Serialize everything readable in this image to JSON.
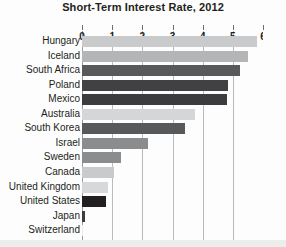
{
  "chart_data": {
    "type": "bar",
    "orientation": "horizontal",
    "title": "Short-Term Interest Rate, 2012",
    "xlabel": "",
    "ylabel": "",
    "xlim": [
      0,
      6
    ],
    "xticks": [
      0,
      1,
      2,
      3,
      4,
      5,
      6
    ],
    "xtick_labels": [
      "0",
      "1",
      "2",
      "3",
      "4",
      "5",
      "6"
    ],
    "grid": true,
    "grid_axis": "x",
    "legend": false,
    "categories": [
      "Hungary",
      "Iceland",
      "South Africa",
      "Poland",
      "Mexico",
      "Australia",
      "South Korea",
      "Israel",
      "Sweden",
      "Canada",
      "United Kingdom",
      "United States",
      "Japan",
      "Switzerland"
    ],
    "values": [
      5.8,
      5.5,
      5.25,
      4.85,
      4.8,
      3.75,
      3.4,
      2.2,
      1.3,
      1.05,
      0.85,
      0.8,
      0.1,
      0.02
    ],
    "bar_colors": [
      "#c9cacb",
      "#b3b5b6",
      "#58595b",
      "#414042",
      "#3c3b3d",
      "#d5d6d7",
      "#58595b",
      "#8a8c8e",
      "#8a8c8e",
      "#c9cacb",
      "#d7d8d9",
      "#231f20",
      "#3c3b3d",
      "#ededed"
    ]
  },
  "colors": {
    "background": "#fdfdfd",
    "title_text": "#231f20",
    "label_text": "#231f20",
    "gridline": "#b9bcbe",
    "axis_zero": "#9a9da0",
    "footer_band": "#eceded"
  }
}
